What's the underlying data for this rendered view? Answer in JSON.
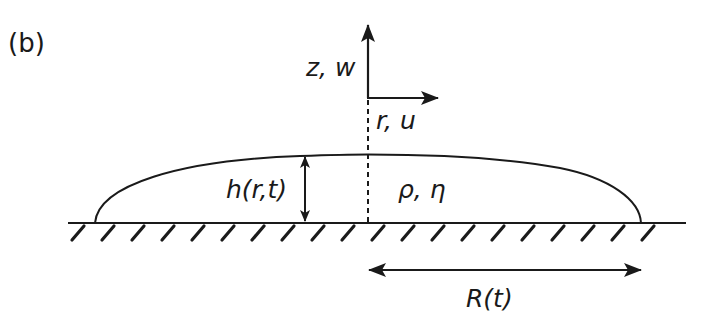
{
  "panel_label": "(b)",
  "axes": {
    "vertical_label": "z, w",
    "horizontal_label": "r, u"
  },
  "droplet": {
    "height_label": "h(r,t)",
    "properties_label": "ρ, η",
    "radius_label": "R(t)"
  },
  "colors": {
    "stroke": "#1a1a1a",
    "background": "#ffffff"
  }
}
